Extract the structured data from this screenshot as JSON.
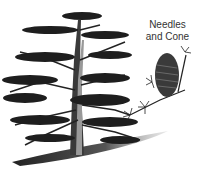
{
  "illustration": {
    "subject": "cedar tree",
    "caption_line1": "Needles",
    "caption_line2": "and Cone"
  },
  "colors": {
    "background": "#ffffff",
    "ink": "#1e1e1e",
    "text": "#333333"
  }
}
